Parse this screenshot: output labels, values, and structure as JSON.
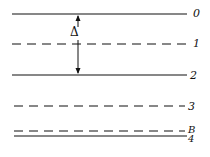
{
  "diagram": {
    "levels": [
      {
        "label": "0",
        "style": "solid",
        "y": 14
      },
      {
        "label": "1",
        "style": "dashed",
        "y": 44
      },
      {
        "label": "2",
        "style": "solid",
        "y": 75
      },
      {
        "label": "3",
        "style": "dashed",
        "y": 106
      },
      {
        "label": "B",
        "style": "dashed",
        "y": 130
      },
      {
        "label": "4",
        "style": "solid",
        "y": 136
      }
    ],
    "interval_symbol": "Δ",
    "interval_from": "0",
    "interval_to": "2"
  }
}
